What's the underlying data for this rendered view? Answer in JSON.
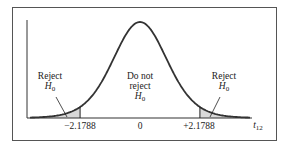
{
  "chart_data": {
    "type": "area",
    "title": "",
    "xlabel": "t12",
    "ylabel": "",
    "distribution": "t distribution, 12 degrees of freedom (two-tailed test)",
    "critical_values": [
      -2.1788,
      2.1788
    ],
    "tick_labels": [
      "-2.1788",
      "0",
      "+2.1788"
    ],
    "x_range": [
      -4,
      4
    ],
    "regions": [
      {
        "name": "Reject H0",
        "range": [
          -4,
          -2.1788
        ],
        "shaded": true
      },
      {
        "name": "Do not reject H0",
        "range": [
          -2.1788,
          2.1788
        ],
        "shaded": false
      },
      {
        "name": "Reject H0",
        "range": [
          2.1788,
          4
        ],
        "shaded": true
      }
    ],
    "annotations": [
      "Reject H0",
      "Do not reject H0",
      "Reject H0"
    ],
    "grid": false,
    "legend": "none"
  },
  "labels": {
    "left_reject_line1": "Reject",
    "left_reject_h": "H",
    "left_reject_sub": "0",
    "center_line1": "Do not",
    "center_line2": "reject",
    "center_h": "H",
    "center_sub": "0",
    "right_reject_line1": "Reject",
    "right_reject_h": "H",
    "right_reject_sub": "0",
    "tick_left": "−2.1788",
    "tick_center": "0",
    "tick_right": "+2.1788",
    "axis_var": "t",
    "axis_sub": "12"
  },
  "colors": {
    "curve": "#333333",
    "shade": "#d9d9d9",
    "frame": "#555555"
  }
}
